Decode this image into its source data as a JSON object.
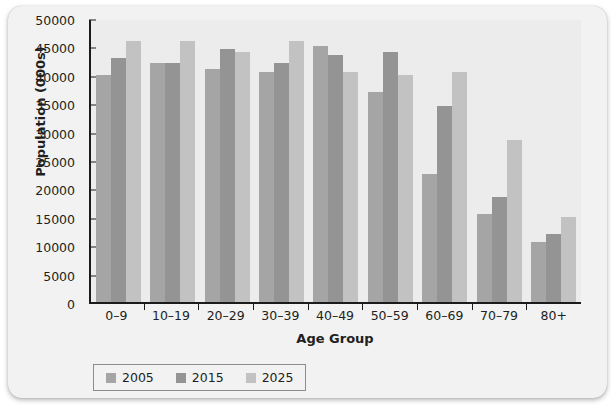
{
  "chart_data": {
    "type": "bar",
    "title": "",
    "xlabel": "Age Group",
    "ylabel": "Population (000s)",
    "categories": [
      "0–9",
      "10–19",
      "20–29",
      "30–39",
      "40–49",
      "50–59",
      "60–69",
      "70–79",
      "80+"
    ],
    "series": [
      {
        "name": "2005",
        "color": "#a5a5a5",
        "values": [
          40000,
          42000,
          41000,
          40500,
          45000,
          37000,
          22500,
          15500,
          10500
        ]
      },
      {
        "name": "2015",
        "color": "#949494",
        "values": [
          43000,
          42000,
          44500,
          42000,
          43500,
          44000,
          34500,
          18500,
          12000
        ]
      },
      {
        "name": "2025",
        "color": "#c2c2c2",
        "values": [
          46000,
          46000,
          44000,
          46000,
          40500,
          40000,
          40500,
          28500,
          15000
        ]
      }
    ],
    "ylim": [
      0,
      50000
    ],
    "yticks": [
      0,
      5000,
      10000,
      15000,
      20000,
      25000,
      30000,
      35000,
      40000,
      45000,
      50000
    ],
    "grid": false,
    "legend_position": "bottom-left"
  },
  "legend": {
    "items": [
      {
        "label": "2005"
      },
      {
        "label": "2015"
      },
      {
        "label": "2025"
      }
    ]
  }
}
